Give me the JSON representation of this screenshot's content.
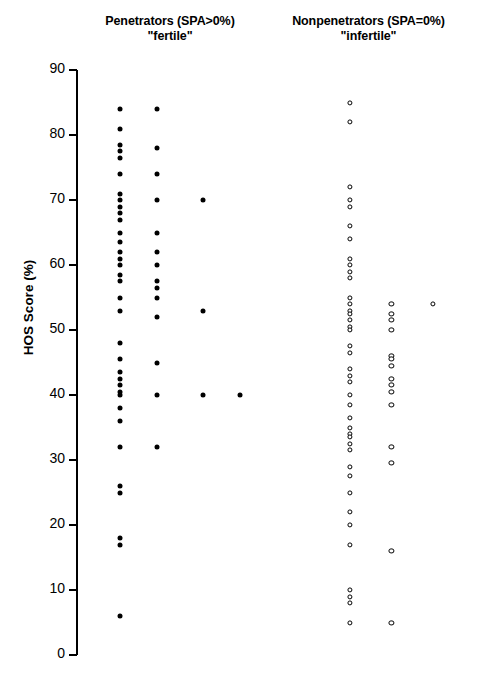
{
  "chart_data": {
    "type": "scatter",
    "title": "",
    "xlabel": "",
    "ylabel": "HOS Score (%)",
    "ylim": [
      0,
      90
    ],
    "yticks": [
      0,
      10,
      20,
      30,
      40,
      50,
      60,
      70,
      80,
      90
    ],
    "grid": false,
    "legend_position": "top-as-column-headings",
    "xlim": [
      0,
      10
    ],
    "groups": [
      {
        "name": "Penetrators (SPA>0%)",
        "subtitle": "\"fertile\"",
        "marker": "filled-circle",
        "marker_color": "#000000",
        "columns": [
          {
            "x": 1.05,
            "values": [
              84,
              81,
              78.5,
              77.5,
              76.5,
              74,
              71,
              70,
              69,
              68,
              67,
              65,
              63.5,
              62,
              61,
              60,
              58.5,
              57.5,
              55,
              53,
              48,
              45.5,
              43.5,
              42.5,
              41.5,
              40.5,
              40,
              38,
              36,
              32,
              26,
              25,
              18,
              17,
              6
            ]
          },
          {
            "x": 1.95,
            "values": [
              84,
              78,
              74,
              70,
              65,
              62,
              60,
              57.5,
              56.5,
              55,
              52,
              45,
              40,
              32
            ]
          },
          {
            "x": 3.05,
            "values": [
              70,
              53,
              40
            ]
          },
          {
            "x": 3.95,
            "values": [
              40
            ]
          }
        ]
      },
      {
        "name": "Nonpenetrators (SPA=0%)",
        "subtitle": "\"infertile\"",
        "marker": "open-circle",
        "marker_color": "#000000",
        "columns": [
          {
            "x": 6.6,
            "values": [
              85,
              82,
              72,
              70,
              69,
              66,
              64,
              61,
              60,
              59,
              58,
              55,
              54,
              53,
              52.5,
              51.5,
              50.5,
              50,
              47.5,
              46.5,
              44,
              43,
              42,
              40,
              38.5,
              36.5,
              35,
              34,
              33.5,
              32.5,
              31.5,
              29,
              27.5,
              25,
              22,
              20,
              17,
              10,
              9,
              8,
              5
            ]
          },
          {
            "x": 7.6,
            "values": [
              54,
              52.5,
              51.5,
              50,
              46,
              45.5,
              44.5,
              42.5,
              41.5,
              40.5,
              38.5,
              32,
              29.5,
              16,
              5
            ]
          },
          {
            "x": 8.6,
            "values": [
              54
            ]
          }
        ]
      }
    ]
  },
  "axis": {
    "y_title": "HOS Score (%)"
  },
  "headings": {
    "left_line1": "Penetrators (SPA>0%)",
    "left_line2": "\"fertile\"",
    "right_line1": "Nonpenetrators (SPA=0%)",
    "right_line2": "\"infertile\""
  }
}
